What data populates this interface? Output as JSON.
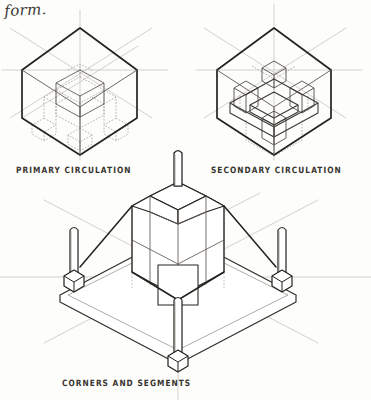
{
  "sheet": {
    "title": "form.",
    "medium": "pencil sketch on paper",
    "background_color": "#fdfdfc",
    "ink_color": "#2b2926",
    "guide_color": "#b9b5ae",
    "hidden_color": "#9a958d"
  },
  "header": {
    "note": "form."
  },
  "captions": {
    "primary": "PRIMARY CIRCULATION",
    "secondary": "SECONDARY CIRCULATION",
    "corners": "CORNERS AND SEGMENTS"
  },
  "figures": [
    {
      "id": "primary-circulation",
      "caption": "PRIMARY CIRCULATION",
      "type": "isometric-cube",
      "description": "Isometric cube envelope with dashed interior vertical circulation shafts and cross-shaped plan",
      "position": "top-left"
    },
    {
      "id": "secondary-circulation",
      "caption": "SECONDARY CIRCULATION",
      "type": "isometric-cube",
      "description": "Isometric cube envelope with horizontal ring platform and four corner blocks",
      "position": "top-right"
    },
    {
      "id": "corners-and-segments",
      "caption": "CORNERS AND SEGMENTS",
      "type": "isometric-assembly",
      "description": "Octagonal central tower on a diamond base slab with four corner columns and a central mast",
      "position": "bottom-center"
    }
  ]
}
